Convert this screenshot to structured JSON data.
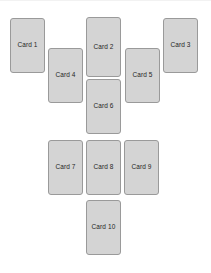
{
  "canvas": {
    "width": 211,
    "height": 273,
    "background_color": "#ffffff"
  },
  "style": {
    "card_fill": "#d4d4d4",
    "card_border": "#9a9a9a",
    "card_text_color": "#262626",
    "card_width": 35,
    "card_height": 55,
    "corner_radius": 3
  },
  "cards": [
    {
      "label": "Card 1",
      "x": 10,
      "y": 18,
      "w": 35,
      "h": 55
    },
    {
      "label": "Card 2",
      "x": 86,
      "y": 17,
      "w": 35,
      "h": 60
    },
    {
      "label": "Card 3",
      "x": 163,
      "y": 18,
      "w": 35,
      "h": 55
    },
    {
      "label": "Card 4",
      "x": 48,
      "y": 48,
      "w": 35,
      "h": 55
    },
    {
      "label": "Card 5",
      "x": 125,
      "y": 48,
      "w": 35,
      "h": 55
    },
    {
      "label": "Card 6",
      "x": 86,
      "y": 79,
      "w": 35,
      "h": 55
    },
    {
      "label": "Card 7",
      "x": 48,
      "y": 140,
      "w": 35,
      "h": 55
    },
    {
      "label": "Card 8",
      "x": 86,
      "y": 140,
      "w": 35,
      "h": 55
    },
    {
      "label": "Card 9",
      "x": 124,
      "y": 140,
      "w": 35,
      "h": 55
    },
    {
      "label": "Card 10",
      "x": 86,
      "y": 200,
      "w": 35,
      "h": 55
    }
  ]
}
